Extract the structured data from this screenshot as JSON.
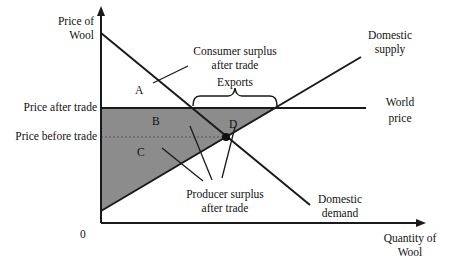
{
  "diagram": {
    "axes": {
      "y_label_line1": "Price of",
      "y_label_line2": "Wool",
      "x_label_line1": "Quantity of",
      "x_label_line2": "Wool",
      "origin": "0"
    },
    "price_levels": {
      "after_trade": "Price after trade",
      "before_trade": "Price before trade"
    },
    "curves": {
      "supply_line1": "Domestic",
      "supply_line2": "supply",
      "demand_line1": "Domestic",
      "demand_line2": "demand",
      "world_line1": "World",
      "world_line2": "price"
    },
    "annotations": {
      "consumer_line1": "Consumer surplus",
      "consumer_line2": "after trade",
      "producer_line1": "Producer surplus",
      "producer_line2": "after trade",
      "exports": "Exports"
    },
    "areas": {
      "a": "A",
      "b": "B",
      "c": "C",
      "d": "D"
    },
    "colors": {
      "shaded": "#8c8c8c",
      "line": "#1a1a1a"
    }
  }
}
